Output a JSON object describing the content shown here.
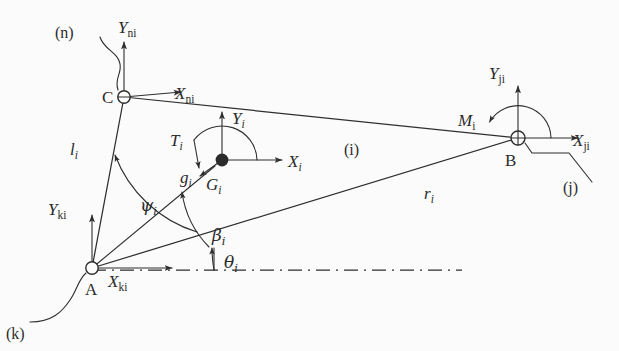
{
  "figure": {
    "background_color": "#fbfbfb",
    "ink_color": "#2e2e2e",
    "width": 619,
    "height": 351
  },
  "points": [
    {
      "id": "A",
      "label": "A",
      "x": 92,
      "y": 268,
      "marker": "open-circle"
    },
    {
      "id": "B",
      "label": "B",
      "x": 518,
      "y": 138,
      "marker": "circled-cross"
    },
    {
      "id": "C",
      "label": "C",
      "x": 124,
      "y": 97,
      "marker": "open-circle"
    },
    {
      "id": "G",
      "label": "G",
      "sub": "i",
      "x": 222,
      "y": 160,
      "marker": "filled-dot"
    }
  ],
  "frames": [
    {
      "name": "frame-n-at-C",
      "origin": "C",
      "x_axis_label": "X",
      "x_axis_sub": "ni",
      "y_axis_label": "Y",
      "y_axis_sub": "ni",
      "tag": "(n)"
    },
    {
      "name": "frame-k-at-A",
      "origin": "A",
      "x_axis_label": "X",
      "x_axis_sub": "ki",
      "y_axis_label": "Y",
      "y_axis_sub": "ki",
      "tag": "(k)"
    },
    {
      "name": "frame-j-at-B",
      "origin": "B",
      "x_axis_label": "X",
      "x_axis_sub": "ji",
      "y_axis_label": "Y",
      "y_axis_sub": "ji",
      "tag": "(j)"
    },
    {
      "name": "frame-body-at-G",
      "origin": "G",
      "x_axis_label": "X",
      "x_axis_sub": "i",
      "y_axis_label": "Y",
      "y_axis_sub": "i",
      "tag": ""
    }
  ],
  "body_label": {
    "text": "(i)",
    "x": 352,
    "y": 148
  },
  "lengths": [
    {
      "id": "l_i",
      "label": "l",
      "sub": "i",
      "from": "A",
      "to": "C",
      "x": 76,
      "y": 148
    },
    {
      "id": "r_i",
      "label": "r",
      "sub": "i",
      "from": "A",
      "to": "B",
      "x": 430,
      "y": 192
    }
  ],
  "angles": [
    {
      "id": "psi_i",
      "glyph": "ψ",
      "sub": "i",
      "x": 148,
      "y": 204,
      "from": "A-G line",
      "to": "A-C line"
    },
    {
      "id": "beta_i",
      "glyph": "β",
      "sub": "i",
      "x": 217,
      "y": 235,
      "from": "A-B line",
      "to": "A-G line"
    },
    {
      "id": "theta_i",
      "glyph": "θ",
      "sub": "i",
      "x": 230,
      "y": 262,
      "from": "horizontal datum",
      "to": "A-B line"
    }
  ],
  "loads": [
    {
      "id": "T_i",
      "label": "T",
      "sub": "i",
      "kind": "torque-arc",
      "at": "G",
      "x": 178,
      "y": 137
    },
    {
      "id": "g_i",
      "label": "g",
      "sub": "i",
      "kind": "gravity-arrow",
      "at": "G",
      "x": 186,
      "y": 175
    },
    {
      "id": "M_i",
      "label": "M",
      "sub": "i",
      "kind": "moment-arc",
      "at": "B",
      "x": 462,
      "y": 118
    }
  ],
  "datum": {
    "id": "horizontal-datum",
    "style": "dash-dot",
    "from_x": 92,
    "to_x": 462,
    "y": 270
  }
}
